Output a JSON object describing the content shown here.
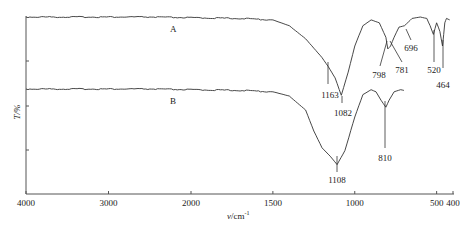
{
  "chart_data": {
    "type": "line",
    "title": "",
    "xlabel": "v/cm⁻¹",
    "xlabel_main": "v",
    "xlabel_unit": "/cm",
    "xlabel_sup": "-1",
    "ylabel": "T/%",
    "xlim": [
      4000,
      400
    ],
    "x_ticks": [
      4000,
      3000,
      2000,
      1500,
      1000,
      500,
      400
    ],
    "x_tick_labels": [
      "4000",
      "3000",
      "2000",
      "1500",
      "1000",
      "500",
      "400"
    ],
    "y_ticks_count": 3,
    "grid": false,
    "legend": "none (curves labeled inline)",
    "series": [
      {
        "name": "A",
        "label": "A",
        "peaks": [
          1163,
          1082,
          798,
          781,
          696,
          520,
          464
        ],
        "peak_labels": [
          "1163",
          "1082",
          "798",
          "781",
          "696",
          "520",
          "464"
        ],
        "points": [
          [
            4000,
            100
          ],
          [
            3500,
            100
          ],
          [
            3000,
            100
          ],
          [
            2500,
            100
          ],
          [
            2000,
            99.5
          ],
          [
            1700,
            99
          ],
          [
            1500,
            98
          ],
          [
            1400,
            94
          ],
          [
            1300,
            85
          ],
          [
            1200,
            72
          ],
          [
            1163,
            66
          ],
          [
            1120,
            58
          ],
          [
            1082,
            46
          ],
          [
            1040,
            62
          ],
          [
            1000,
            80
          ],
          [
            950,
            94
          ],
          [
            900,
            98
          ],
          [
            850,
            96
          ],
          [
            810,
            86
          ],
          [
            798,
            78
          ],
          [
            781,
            80
          ],
          [
            760,
            86
          ],
          [
            730,
            93
          ],
          [
            696,
            94
          ],
          [
            650,
            99
          ],
          [
            600,
            100
          ],
          [
            560,
            99
          ],
          [
            540,
            94
          ],
          [
            520,
            88
          ],
          [
            500,
            96
          ],
          [
            480,
            90
          ],
          [
            464,
            80
          ],
          [
            450,
            96
          ],
          [
            440,
            99
          ],
          [
            420,
            98
          ]
        ]
      },
      {
        "name": "B",
        "label": "B",
        "peaks": [
          1108,
          810
        ],
        "peak_labels": [
          "1108",
          "810"
        ],
        "points": [
          [
            4000,
            100
          ],
          [
            3500,
            100
          ],
          [
            3000,
            100
          ],
          [
            2500,
            100
          ],
          [
            2000,
            99.5
          ],
          [
            1700,
            99
          ],
          [
            1500,
            98
          ],
          [
            1400,
            95
          ],
          [
            1300,
            85
          ],
          [
            1250,
            70
          ],
          [
            1200,
            58
          ],
          [
            1150,
            52
          ],
          [
            1108,
            46
          ],
          [
            1060,
            56
          ],
          [
            1000,
            80
          ],
          [
            950,
            96
          ],
          [
            900,
            99.5
          ],
          [
            870,
            98
          ],
          [
            840,
            92
          ],
          [
            810,
            87
          ],
          [
            790,
            92
          ],
          [
            760,
            98
          ],
          [
            720,
            99.5
          ],
          [
            700,
            99
          ]
        ]
      }
    ]
  },
  "labels": {
    "curve_a": "A",
    "curve_b": "B",
    "ylabel": "T/%"
  }
}
